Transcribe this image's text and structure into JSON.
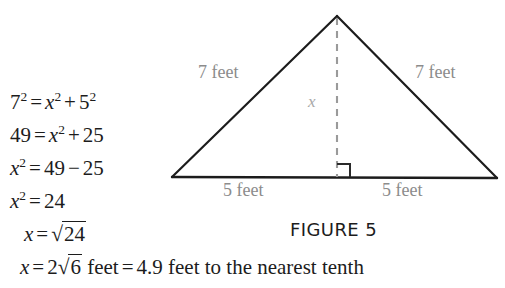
{
  "figure": {
    "caption": "FIGURE 5",
    "labels": {
      "left_side": "7 feet",
      "right_side": "7 feet",
      "base_left": "5 feet",
      "base_right": "5 feet",
      "height": "x"
    },
    "geometry": {
      "apex": [
        337,
        16
      ],
      "base_left_vertex": [
        172,
        177
      ],
      "base_right_vertex": [
        497,
        178
      ],
      "altitude_foot": [
        337,
        177
      ],
      "right_angle_marker_size": 13,
      "stroke_color": "#1c1c1c",
      "dashed_color": "#9a9a9a"
    }
  },
  "equations": [
    {
      "id": "eq-1",
      "text": "7² = x² + 5²",
      "parts": {
        "lhs_base": "7",
        "lhs_exp": "2",
        "eq": "=",
        "var": "x",
        "var_exp": "2",
        "plus": "+",
        "rhs_base": "5",
        "rhs_exp": "2"
      }
    },
    {
      "id": "eq-2",
      "text": "49 = x² + 25",
      "parts": {
        "lhs": "49",
        "eq": "=",
        "var": "x",
        "var_exp": "2",
        "plus": "+",
        "rhs": "25"
      }
    },
    {
      "id": "eq-3",
      "text": "x² = 49 − 25",
      "parts": {
        "var": "x",
        "var_exp": "2",
        "eq": "=",
        "a": "49",
        "minus": "−",
        "b": "25"
      }
    },
    {
      "id": "eq-4",
      "text": "x² = 24",
      "parts": {
        "var": "x",
        "var_exp": "2",
        "eq": "=",
        "rhs": "24"
      }
    },
    {
      "id": "eq-5",
      "text": "x = √24",
      "parts": {
        "var": "x",
        "eq": "=",
        "radical_sign": "√",
        "radicand": "24"
      }
    }
  ],
  "final_line": {
    "var": "x",
    "eq1": "=",
    "coefficient": "2",
    "radical_sign": "√",
    "radicand": "6",
    "unit": "feet",
    "eq2": "=",
    "value": "4.9",
    "unit2": "feet",
    "qualifier": "to the nearest tenth"
  }
}
